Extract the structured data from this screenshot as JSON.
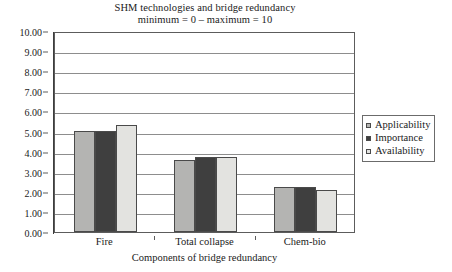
{
  "chart_data": {
    "type": "bar",
    "title": "SHM technologies and bridge redundancy",
    "subtitle": "minimum = 0 – maximum = 10",
    "xlabel": "Components of bridge redundancy",
    "ylabel": "",
    "ylim": [
      0,
      10
    ],
    "ytick_step": 1,
    "grid": true,
    "legend_position": "right",
    "categories": [
      "Fire",
      "Total collapse",
      "Chem-bio"
    ],
    "ytick_labels": [
      "0.00",
      "1.00",
      "2.00",
      "3.00",
      "4.00",
      "5.00",
      "6.00",
      "7.00",
      "8.00",
      "9.00",
      "10.00"
    ],
    "series": [
      {
        "name": "Applicability",
        "color": "#b4b4b2",
        "values": [
          5.05,
          3.6,
          2.25
        ]
      },
      {
        "name": "Importance",
        "color": "#3f3f3f",
        "values": [
          5.05,
          3.72,
          2.25
        ]
      },
      {
        "name": "Availability",
        "color": "#e3e3e0",
        "values": [
          5.3,
          3.75,
          2.1
        ]
      }
    ]
  },
  "style": {
    "plot_border_color": "#5c5c5c",
    "gridline_color": "#8d8d8d",
    "bar_outline_color": "#4a4a4a",
    "text_color": "#1a1a1a",
    "background": "#ffffff"
  }
}
